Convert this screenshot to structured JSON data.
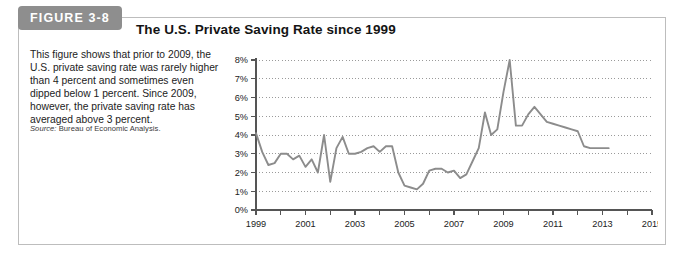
{
  "figure": {
    "tag_label": "FIGURE 3-8",
    "title": "The U.S. Private Saving Rate since 1999",
    "caption": "This figure shows that prior to 2009, the U.S. private saving rate was rarely higher than 4 percent and sometimes even dipped below 1 percent. Since 2009, however, the private saving rate has averaged above 3 percent.",
    "source_lead": "Source:",
    "source_text": " Bureau of Economic Analysis."
  },
  "colors": {
    "tag_background": "#8e8e8e",
    "tag_text": "#ffffff",
    "line": "#8c8c8c",
    "axis": "#555555",
    "gridline": "#9a9a9a",
    "frame": "#bdbdbd",
    "text": "#1c1c1c"
  },
  "chart_data": {
    "type": "line",
    "title": "The U.S. Private Saving Rate since 1999",
    "xlabel": "",
    "ylabel": "",
    "xlim": [
      1999,
      2015
    ],
    "ylim": [
      0,
      8
    ],
    "grid": true,
    "legend": "none",
    "y_ticks": [
      0,
      1,
      2,
      3,
      4,
      5,
      6,
      7,
      8
    ],
    "y_tick_labels": [
      "0%",
      "1%",
      "2%",
      "3%",
      "4%",
      "5%",
      "6%",
      "7%",
      "8%"
    ],
    "x_ticks": [
      1999,
      2000,
      2001,
      2002,
      2003,
      2004,
      2005,
      2006,
      2007,
      2008,
      2009,
      2010,
      2011,
      2012,
      2013,
      2014,
      2015
    ],
    "x_tick_labels": [
      "1999",
      "",
      "2001",
      "",
      "2003",
      "",
      "2005",
      "",
      "2007",
      "",
      "2009",
      "",
      "2011",
      "",
      "2013",
      "",
      "2015"
    ],
    "series": [
      {
        "name": "U.S. private saving rate",
        "x": [
          1999.0,
          1999.25,
          1999.5,
          1999.75,
          2000.0,
          2000.25,
          2000.5,
          2000.75,
          2001.0,
          2001.25,
          2001.5,
          2001.75,
          2002.0,
          2002.25,
          2002.5,
          2002.75,
          2003.0,
          2003.25,
          2003.5,
          2003.75,
          2004.0,
          2004.25,
          2004.5,
          2004.75,
          2005.0,
          2005.25,
          2005.5,
          2005.75,
          2006.0,
          2006.25,
          2006.5,
          2006.75,
          2007.0,
          2007.25,
          2007.5,
          2007.75,
          2008.0,
          2008.25,
          2008.5,
          2008.75,
          2009.0,
          2009.25,
          2009.5,
          2009.75,
          2010.0,
          2010.25,
          2010.5,
          2010.75,
          2011.0,
          2011.25,
          2011.5,
          2011.75,
          2012.0,
          2012.25,
          2012.5,
          2012.75,
          2013.0,
          2013.25
        ],
        "values": [
          4.1,
          3.1,
          2.4,
          2.5,
          3.0,
          3.0,
          2.7,
          2.9,
          2.3,
          2.7,
          2.0,
          4.0,
          1.5,
          3.3,
          3.9,
          3.0,
          3.0,
          3.1,
          3.3,
          3.4,
          3.1,
          3.4,
          3.4,
          2.0,
          1.3,
          1.2,
          1.1,
          1.4,
          2.1,
          2.2,
          2.2,
          2.0,
          2.1,
          1.7,
          1.9,
          2.6,
          3.3,
          5.2,
          4.0,
          4.3,
          6.3,
          8.0,
          4.5,
          4.5,
          5.1,
          5.5,
          5.1,
          4.7,
          4.6,
          4.5,
          4.4,
          4.3,
          4.2,
          3.4,
          3.3,
          3.3,
          3.3,
          3.3
        ]
      }
    ]
  }
}
